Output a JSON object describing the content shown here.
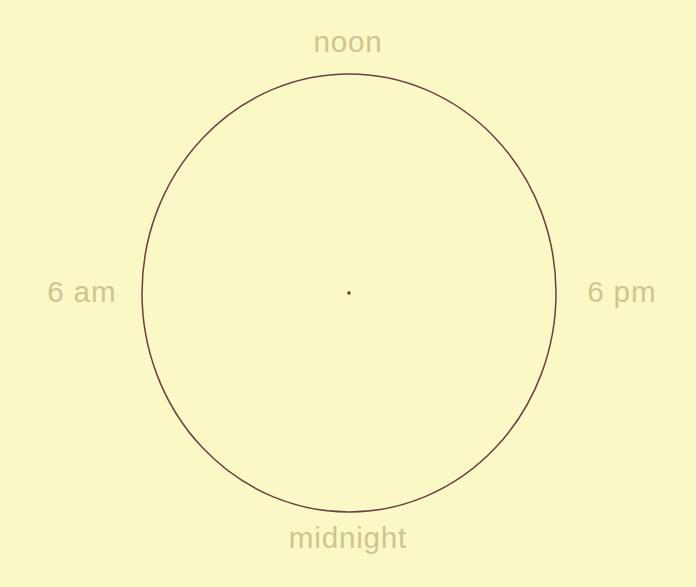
{
  "canvas": {
    "width": 696,
    "height": 587,
    "background_color": "#faf8c6"
  },
  "figure": {
    "kind": "day-cycle-ellipse",
    "stroke_color": "#6e4040",
    "stroke_width": 1.5,
    "center_dot_color": "#5e3535",
    "center_x": 349,
    "center_y": 293,
    "radius_x": 207,
    "radius_y": 219
  },
  "labels": {
    "color": "#cfc492",
    "top": "noon",
    "bottom": "midnight",
    "left": "6 am",
    "right": "6 pm"
  }
}
